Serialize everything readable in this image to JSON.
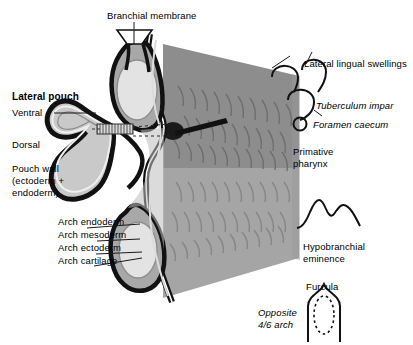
{
  "figure": {
    "background_color": "#ffffff",
    "width": 413,
    "height": 345
  },
  "colors": {
    "outline_black": "#111111",
    "mesoderm_gray": "#a8a8a8",
    "cartilage_light": "#e3e3e3",
    "pharynx_gray_dark": "#8d8d8d",
    "pharynx_gray_light": "#a5a5a5",
    "pouch_fill": "#c9c9c9",
    "leader_line": "#1a1a1a",
    "text": "#000000"
  },
  "labels": {
    "branchial_membrane": "Branchial membrane",
    "lateral_pouch": "Lateral pouch",
    "ventral": "Ventral",
    "dorsal": "Dorsal",
    "pouch_wall_line1": "Pouch wall",
    "pouch_wall_line2": "(ectoderm +",
    "pouch_wall_line3": "endoderm)",
    "arch_endoderm": "Arch endoderm",
    "arch_mesoderm": "Arch mesoderm",
    "arch_ectoderm": "Arch ectoderm",
    "arch_cartilage": "Arch cartilage",
    "lateral_lingual_swellings": "Lateral lingual swellings",
    "tuberculum_impar": "Tuberculum impar",
    "foramen_caecum": "Foramen caecum",
    "primative_pharynx_line1": "Primative",
    "primative_pharynx_line2": "pharynx",
    "hypobranchial_line1": "Hypobranchial",
    "hypobranchial_line2": "eminence",
    "furcula": "Furcula",
    "opposite_line1": "Opposite",
    "opposite_line2": "4/6 arch"
  },
  "structures": [
    {
      "name": "branchial-membrane",
      "description": "funnel shaped membrane at top of arch column"
    },
    {
      "name": "upper-arch",
      "description": "upper pharyngeal arch with oval cartilage core"
    },
    {
      "name": "lower-arch",
      "description": "lower pharyngeal arch with oval cartilage core"
    },
    {
      "name": "lateral-pouch",
      "description": "bilobed pouch with ventral and dorsal lobes"
    },
    {
      "name": "pouch-neck",
      "description": "hatched connecting neck between pouch and pharynx"
    },
    {
      "name": "probe-pointer",
      "description": "black probe entering the primative pharynx"
    },
    {
      "name": "primative-pharynx",
      "description": "two-tone gray wedge with hair-like striations"
    },
    {
      "name": "lateral-lingual-swelling-left",
      "description": "open arc outline"
    },
    {
      "name": "lateral-lingual-swelling-right",
      "description": "open arc outline"
    },
    {
      "name": "tuberculum-impar",
      "description": "small open arc outline"
    },
    {
      "name": "foramen-caecum",
      "description": "small open circle"
    },
    {
      "name": "hypobranchial-eminence",
      "description": "double humped outline"
    },
    {
      "name": "furcula",
      "description": "pointed arch outline with dotted oval inside"
    }
  ]
}
